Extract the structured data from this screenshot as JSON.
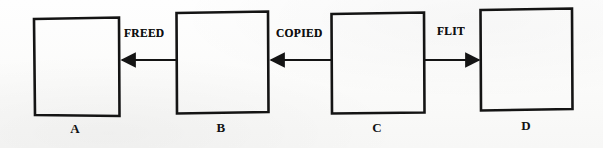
{
  "diagram": {
    "type": "node-link-diagram",
    "background_color": "#fdfdfc",
    "ink_color": "#141414",
    "nodes": [
      {
        "id": "A",
        "label": "A",
        "x": 34,
        "y": 18,
        "width": 85,
        "height": 98,
        "label_x": 75,
        "label_y": 122
      },
      {
        "id": "B",
        "label": "B",
        "x": 176,
        "y": 12,
        "width": 92,
        "height": 101,
        "label_x": 221,
        "label_y": 121
      },
      {
        "id": "C",
        "label": "C",
        "x": 331,
        "y": 13,
        "width": 93,
        "height": 100,
        "label_x": 377,
        "label_y": 121
      },
      {
        "id": "D",
        "label": "D",
        "x": 480,
        "y": 9,
        "width": 92,
        "height": 101,
        "label_x": 526,
        "label_y": 119
      }
    ],
    "edges": [
      {
        "id": "edge-freed",
        "label": "FREED",
        "from": "B",
        "to": "A",
        "direction": "left",
        "x1": 176,
        "x2": 120,
        "y": 60,
        "label_x": 124,
        "label_y": 28
      },
      {
        "id": "edge-copied",
        "label": "COPIED",
        "from": "C",
        "to": "B",
        "direction": "left",
        "x1": 331,
        "x2": 269,
        "y": 60,
        "label_x": 276,
        "label_y": 28
      },
      {
        "id": "edge-flit",
        "label": "FLIT",
        "from": "C",
        "to": "D",
        "direction": "right",
        "x1": 425,
        "x2": 481,
        "y": 60,
        "label_x": 437,
        "label_y": 26
      }
    ]
  }
}
